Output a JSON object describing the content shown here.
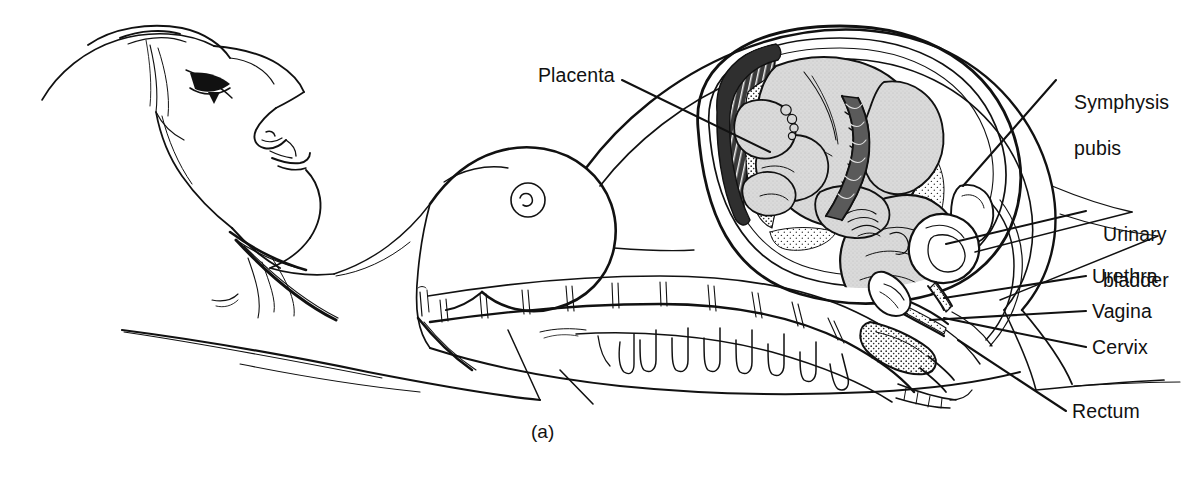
{
  "figure": {
    "caption": "(a)",
    "background_color": "#ffffff",
    "ink_color": "#111111"
  },
  "labels": [
    {
      "id": "placenta",
      "text": "Placenta",
      "side": "left",
      "text_x": 538,
      "text_y": 64,
      "leader": [
        [
          622,
          80
        ],
        [
          700,
          118
        ]
      ]
    },
    {
      "id": "symphysis-pubis",
      "text": "Symphysis\npubis",
      "line1": "Symphysis",
      "line2": "pubis",
      "side": "right",
      "text_x": 1063,
      "text_y": 68,
      "leader": [
        [
          1056,
          80
        ],
        [
          963,
          184
        ]
      ]
    },
    {
      "id": "urinary-bladder",
      "text": "Urinary\nbladder",
      "line1": "Urinary",
      "line2": "bladder",
      "side": "right",
      "text_x": 1092,
      "text_y": 200,
      "leader": [
        [
          1086,
          211
        ],
        [
          946,
          243
        ]
      ]
    },
    {
      "id": "urethra",
      "text": "Urethra",
      "side": "right",
      "text_x": 1092,
      "text_y": 265,
      "leader": [
        [
          1086,
          276
        ],
        [
          948,
          296
        ]
      ]
    },
    {
      "id": "vagina",
      "text": "Vagina",
      "side": "right",
      "text_x": 1092,
      "text_y": 300,
      "leader": [
        [
          1086,
          311
        ],
        [
          946,
          318
        ]
      ]
    },
    {
      "id": "cervix",
      "text": "Cervix",
      "side": "right",
      "text_x": 1092,
      "text_y": 336,
      "leader": [
        [
          1086,
          347
        ],
        [
          955,
          326
        ]
      ]
    },
    {
      "id": "rectum",
      "text": "Rectum",
      "side": "right",
      "text_x": 1072,
      "text_y": 400,
      "leader": [
        [
          1066,
          411
        ],
        [
          963,
          343
        ]
      ]
    }
  ],
  "colors": {
    "ink": "#111111",
    "fetus_fill": "#d6d6d6",
    "fetus_fill_dark": "#c4c4c4",
    "placenta_dark": "#3a3a3a",
    "placenta_stipple": "#ffffff",
    "cord_fill": "#555555",
    "paper": "#ffffff"
  },
  "structures": [
    "maternal head in profile, reclining, facing upward",
    "neck and clavicle",
    "breast with areola and nipple",
    "abdominal wall distended by gravid uterus",
    "lumbar and sacral vertebral column with spinous processes",
    "uterus with double wall and amniotic cavity",
    "full-term fetus in vertex (head-down) presentation",
    "placenta implanted on fundal/posterior uterine wall",
    "umbilical cord, twisted",
    "urinary bladder",
    "urethra",
    "symphysis pubis",
    "vagina",
    "cervix",
    "rectum"
  ]
}
